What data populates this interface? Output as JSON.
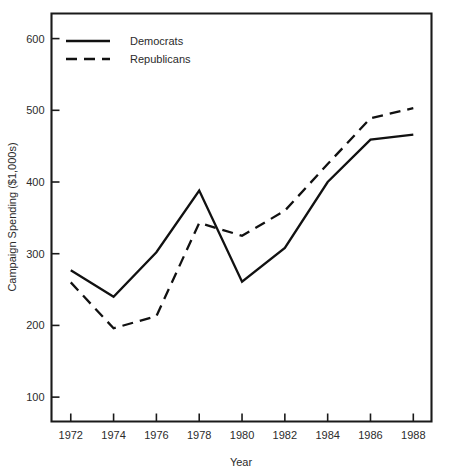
{
  "chart_data": {
    "type": "line",
    "title": "",
    "xlabel": "Year",
    "ylabel": "Campaign Spending ($1,000s)",
    "x": [
      1972,
      1974,
      1976,
      1978,
      1980,
      1982,
      1984,
      1986,
      1988
    ],
    "xtick_labels": [
      "1972",
      "1974",
      "1976",
      "1978",
      "1980",
      "1982",
      "1984",
      "1986",
      "1988"
    ],
    "ytick_labels": [
      "600",
      "500",
      "400",
      "300",
      "200",
      "100"
    ],
    "yticks": [
      600,
      500,
      400,
      300,
      200,
      100
    ],
    "xlim": [
      1971.1,
      1988.85
    ],
    "ylim": [
      66,
      635
    ],
    "grid": false,
    "legend_position": "upper-left",
    "series": [
      {
        "name": "Democrats",
        "style": "solid",
        "color": "#111111",
        "values": [
          277,
          240,
          302,
          388,
          261,
          308,
          400,
          459,
          466
        ]
      },
      {
        "name": "Republicans",
        "style": "dashed",
        "color": "#111111",
        "values": [
          260,
          196,
          213,
          343,
          325,
          360,
          425,
          489,
          503
        ]
      }
    ]
  }
}
